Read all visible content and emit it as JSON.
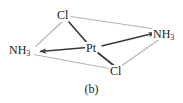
{
  "figure": {
    "caption": "(b)",
    "title": "",
    "colors": {
      "bond": "#3a3a3a",
      "guide": "#b4b4b4",
      "text": "#1a1a1a",
      "background": "#ffffff"
    }
  },
  "molecule": {
    "center": {
      "id": "pt",
      "formula": "Pt",
      "symbol": "Pt",
      "subscript": "",
      "x": 93,
      "y": 48
    },
    "ligands": [
      {
        "id": "cl-top",
        "formula": "Cl",
        "symbol": "Cl",
        "subscript": "",
        "x": 64,
        "y": 15,
        "bond_arrow": false
      },
      {
        "id": "nh3-left",
        "formula": "NH3",
        "symbol": "NH",
        "subscript": "3",
        "x": 24,
        "y": 50,
        "bond_arrow": true
      },
      {
        "id": "nh3-right",
        "formula": "NH3",
        "symbol": "NH",
        "subscript": "3",
        "x": 166,
        "y": 34,
        "bond_arrow": true
      },
      {
        "id": "cl-bottom",
        "formula": "Cl",
        "symbol": "Cl",
        "subscript": "",
        "x": 116,
        "y": 71,
        "bond_arrow": false
      }
    ],
    "bonds": [
      {
        "id": "bond-pt-cl-top",
        "from": "pt",
        "to": "cl-top",
        "style": "solid-dark",
        "arrow": false
      },
      {
        "id": "bond-pt-nh3-left",
        "from": "pt",
        "to": "nh3-left",
        "style": "solid-dark",
        "arrow": true
      },
      {
        "id": "bond-pt-nh3-right",
        "from": "pt",
        "to": "nh3-right",
        "style": "solid-dark",
        "arrow": true
      },
      {
        "id": "bond-pt-cl-bottom",
        "from": "pt",
        "to": "cl-bottom",
        "style": "solid-dark",
        "arrow": false
      }
    ],
    "guide_edges": [
      {
        "id": "guide-cl-top-nh3-left",
        "from": "cl-top",
        "to": "nh3-left"
      },
      {
        "id": "guide-cl-top-nh3-right",
        "from": "cl-top",
        "to": "nh3-right"
      },
      {
        "id": "guide-nh3-right-cl-bottom",
        "from": "nh3-right",
        "to": "cl-bottom"
      },
      {
        "id": "guide-cl-bottom-nh3-left",
        "from": "cl-bottom",
        "to": "nh3-left"
      }
    ]
  }
}
